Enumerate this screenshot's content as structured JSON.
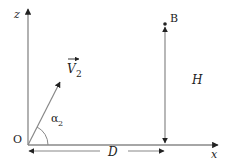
{
  "diagram": {
    "type": "projectile-geometry",
    "labels": {
      "z_axis": "z",
      "x_axis": "x",
      "origin": "O",
      "point": "B",
      "velocity": "V",
      "velocity_sub": "2",
      "angle": "α",
      "angle_sub": "2",
      "height": "H",
      "distance": "D"
    },
    "colors": {
      "axis": "#888888",
      "arrowhead": "#222222",
      "text": "#222222",
      "background": "#ffffff"
    }
  }
}
